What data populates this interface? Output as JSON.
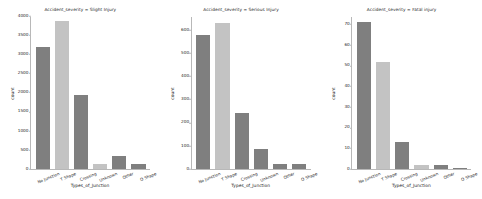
{
  "figure": {
    "background_color": "#ffffff",
    "palette": {
      "dark_gray": "#7f7f7f",
      "light_gray": "#c3c3c3",
      "axis_color": "#b8b8b8",
      "text_color": "#262626"
    }
  },
  "chart_data": [
    {
      "type": "bar",
      "title": "Accident_severity = Slight Injury",
      "xlabel": "Types_of_Junction",
      "ylabel": "count",
      "categories": [
        "No Junction",
        "T Shape",
        "Crossing",
        "Unknown",
        "Other",
        "O Shape"
      ],
      "values": [
        3200,
        3870,
        1940,
        120,
        350,
        130
      ],
      "bar_colors": [
        "#7f7f7f",
        "#c3c3c3",
        "#7f7f7f",
        "#c3c3c3",
        "#7f7f7f",
        "#7f7f7f"
      ],
      "ylim": [
        0,
        4000
      ],
      "yticks": [
        0,
        500,
        1000,
        1500,
        2000,
        2500,
        3000,
        3500,
        4000
      ],
      "ytick_labels": [
        "0",
        "500",
        "1000",
        "1500",
        "2000",
        "2500",
        "3000",
        "3500",
        "4000"
      ],
      "grid": false,
      "legend": "none"
    },
    {
      "type": "bar",
      "title": "Accident_severity = Serious Injury",
      "xlabel": "Types_of_Junction",
      "ylabel": "count",
      "categories": [
        "No Junction",
        "T Shape",
        "Crossing",
        "Unknown",
        "Other",
        "O Shape"
      ],
      "values": [
        580,
        630,
        240,
        85,
        20,
        20
      ],
      "bar_colors": [
        "#7f7f7f",
        "#c3c3c3",
        "#7f7f7f",
        "#7f7f7f",
        "#7f7f7f",
        "#7f7f7f"
      ],
      "ylim": [
        0,
        660
      ],
      "yticks": [
        0,
        100,
        200,
        300,
        400,
        500,
        600
      ],
      "ytick_labels": [
        "0",
        "100",
        "200",
        "300",
        "400",
        "500",
        "600"
      ],
      "grid": false,
      "legend": "none"
    },
    {
      "type": "bar",
      "title": "Accident_severity = Fatal injury",
      "xlabel": "Types_of_Junction",
      "ylabel": "count",
      "categories": [
        "No Junction",
        "T Shape",
        "Crossing",
        "Unknown",
        "Other",
        "O Shape"
      ],
      "values": [
        71,
        52,
        13,
        2,
        2,
        0.5
      ],
      "bar_colors": [
        "#7f7f7f",
        "#c3c3c3",
        "#7f7f7f",
        "#c3c3c3",
        "#7f7f7f",
        "#7f7f7f"
      ],
      "ylim": [
        0,
        74
      ],
      "yticks": [
        0,
        10,
        20,
        30,
        40,
        50,
        60,
        70
      ],
      "ytick_labels": [
        "0",
        "10",
        "20",
        "30",
        "40",
        "50",
        "60",
        "70"
      ],
      "grid": false,
      "legend": "none"
    }
  ]
}
